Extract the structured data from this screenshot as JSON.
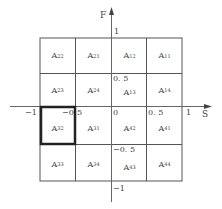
{
  "axes": {
    "x_label": "S",
    "y_label": "F",
    "x_ticks": [
      "-1",
      "-0.5",
      "0",
      "0.5",
      "1"
    ],
    "y_ticks": [
      "1",
      "0.5",
      "-0.5",
      "-1"
    ]
  },
  "grid": {
    "rows": [
      [
        "22",
        "21",
        "12",
        "11"
      ],
      [
        "23",
        "24",
        "13",
        "14"
      ],
      [
        "32",
        "31",
        "42",
        "41"
      ],
      [
        "33",
        "34",
        "43",
        "44"
      ]
    ],
    "cell_prefix": "A",
    "highlighted_cell": "A32"
  },
  "labels": {
    "x_neg1": "−1",
    "x_neg05": "−0",
    "x_neg05_tail": "5",
    "x_zero": "0",
    "x_pos05": "0. 5",
    "x_pos1": "1",
    "y_pos1": "1",
    "y_pos05": "0. 5",
    "y_neg05": "−0. 5",
    "y_neg1": "−1"
  },
  "colors": {
    "grid_line": "#555555",
    "axis_line": "#666666",
    "highlight_border": "#222222"
  }
}
